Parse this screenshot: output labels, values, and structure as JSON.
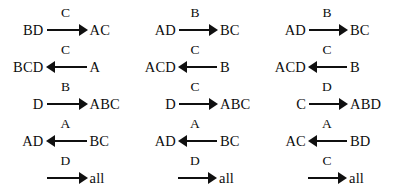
{
  "diagram": {
    "arrow_glyph_right": "right-arrow",
    "arrow_glyph_left": "left-arrow",
    "ink_color": "#101010",
    "background_color": "#ffffff",
    "columns": [
      {
        "name": "column-1",
        "rows": [
          {
            "label": "C",
            "left": "BD",
            "right": "AC",
            "direction": "right"
          },
          {
            "label": "C",
            "left": "BCD",
            "right": "A",
            "direction": "left"
          },
          {
            "label": "B",
            "left": "D",
            "right": "ABC",
            "direction": "right"
          },
          {
            "label": "A",
            "left": "AD",
            "right": "BC",
            "direction": "left"
          },
          {
            "label": "D",
            "left": "",
            "right": "all",
            "direction": "right"
          }
        ]
      },
      {
        "name": "column-2",
        "rows": [
          {
            "label": "B",
            "left": "AD",
            "right": "BC",
            "direction": "right"
          },
          {
            "label": "C",
            "left": "ACD",
            "right": "B",
            "direction": "left"
          },
          {
            "label": "C",
            "left": "D",
            "right": "ABC",
            "direction": "right"
          },
          {
            "label": "A",
            "left": "AD",
            "right": "BC",
            "direction": "left"
          },
          {
            "label": "D",
            "left": "",
            "right": "all",
            "direction": "right"
          }
        ]
      },
      {
        "name": "column-3",
        "rows": [
          {
            "label": "B",
            "left": "AD",
            "right": "BC",
            "direction": "right"
          },
          {
            "label": "C",
            "left": "ACD",
            "right": "B",
            "direction": "left"
          },
          {
            "label": "D",
            "left": "C",
            "right": "ABD",
            "direction": "right"
          },
          {
            "label": "A",
            "left": "AC",
            "right": "BD",
            "direction": "left"
          },
          {
            "label": "C",
            "left": "",
            "right": "all",
            "direction": "right"
          }
        ]
      }
    ]
  }
}
